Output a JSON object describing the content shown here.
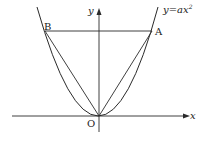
{
  "diagram": {
    "type": "coordinate-plane-parabola",
    "curve_label": "y=ax",
    "curve_label_exponent": "2",
    "axis_x_label": "x",
    "axis_y_label": "y",
    "origin_label": "O",
    "points": [
      {
        "name": "A",
        "label": "A"
      },
      {
        "name": "B",
        "label": "B"
      }
    ],
    "segments": [
      "BA",
      "OA",
      "OB"
    ],
    "colors": {
      "line": "#2a2a2a",
      "background": "#ffffff"
    }
  }
}
